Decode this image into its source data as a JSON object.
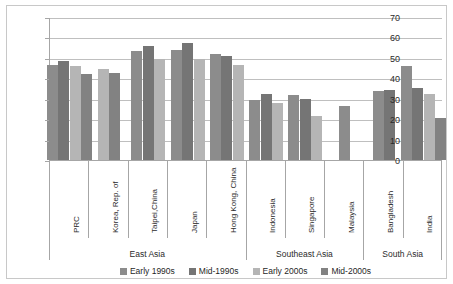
{
  "figure": {
    "title_faint": "",
    "frame_color": "#c8c8c8"
  },
  "chart_data": {
    "type": "bar",
    "title": "",
    "subtitle": "",
    "xlabel": "",
    "ylabel": "% Share",
    "ylim": [
      0,
      70
    ],
    "ytick_step": 10,
    "yticks": [
      0,
      10,
      20,
      30,
      40,
      50,
      60,
      70
    ],
    "ytick_labels": [
      "0",
      "10",
      "20",
      "30",
      "40",
      "50",
      "60",
      "70"
    ],
    "grid": true,
    "grid_axis": "y",
    "legend_position": "bottom",
    "categories": [
      "PRC",
      "Korea, Rep. of",
      "Taipei,China",
      "Japan",
      "Hong Kong, China",
      "Indonesia",
      "Singapore",
      "Malaysia",
      "Bangladesh",
      "India"
    ],
    "groups": [
      {
        "label": "East Asia",
        "categories": [
          "PRC",
          "Korea, Rep. of",
          "Taipei,China",
          "Japan",
          "Hong Kong, China"
        ]
      },
      {
        "label": "Southeast Asia",
        "categories": [
          "Indonesia",
          "Singapore",
          "Malaysia"
        ]
      },
      {
        "label": "South Asia",
        "categories": [
          "Bangladesh",
          "India"
        ]
      }
    ],
    "series": [
      {
        "name": "Early 1990s",
        "color": "#8c8c8c",
        "values": [
          46.3,
          null,
          53.2,
          53.8,
          52.0,
          29.6,
          31.8,
          26.4,
          34.0,
          46.0
        ]
      },
      {
        "name": "Mid-1990s",
        "color": "#757575",
        "values": [
          48.3,
          null,
          55.9,
          57.2,
          50.7,
          32.3,
          30.1,
          null,
          34.4,
          35.2
        ]
      },
      {
        "name": "Early 2000s",
        "color": "#b5b5b5",
        "values": [
          46.2,
          44.5,
          49.3,
          49.4,
          46.6,
          28.1,
          21.7,
          null,
          null,
          32.1
        ]
      },
      {
        "name": "Mid-2000s",
        "color": "#828282",
        "values": [
          41.9,
          42.5,
          null,
          null,
          null,
          null,
          null,
          null,
          null,
          20.5
        ]
      }
    ]
  }
}
